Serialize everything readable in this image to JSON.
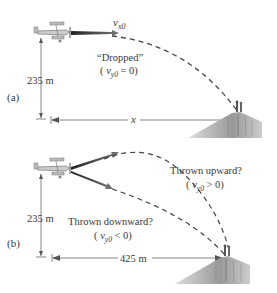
{
  "panel_a": {
    "label": "(a)",
    "velocity_label": "v",
    "velocity_sub": "x0",
    "trajectory_label": "“Dropped”",
    "condition_open": "( ",
    "condition_v": "v",
    "condition_sub": "y0",
    "condition_rest": " = 0)",
    "height_label": "235 m",
    "distance_label": "x"
  },
  "panel_b": {
    "label": "(b)",
    "up_label": "Thrown upward?",
    "up_cond_open": "( ",
    "up_cond_v": "v",
    "up_cond_sub": "y0",
    "up_cond_rest": " > 0)",
    "down_label": "Thrown downward?",
    "down_cond_open": "( ",
    "down_cond_v": "v",
    "down_cond_sub": "y0",
    "down_cond_rest": " < 0)",
    "height_label": "235 m",
    "distance_label": "425 m"
  },
  "colors": {
    "text": "#3a3a3a",
    "line": "#555555",
    "arrow": "#333333",
    "cliff": "#9a9a9a"
  }
}
